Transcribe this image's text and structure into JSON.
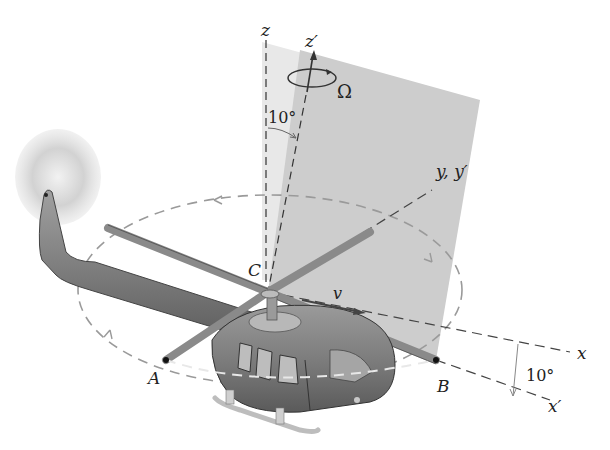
{
  "figure": {
    "colors": {
      "plane_light": "#e6e6e6",
      "plane_dark": "#c8c8c8",
      "body": "#7a7a7a",
      "body_dark": "#555555",
      "rotor": "#8c8c8c",
      "dash": "#9a9a9a",
      "axis": "#333333"
    },
    "labels": {
      "z": "z",
      "z_prime": "z′",
      "omega": "Ω",
      "angle_top": "10°",
      "y_axes": "y, y′",
      "C": "C",
      "v": "v",
      "A": "A",
      "B": "B",
      "x": "x",
      "x_prime": "x′",
      "angle_right": "10°"
    }
  }
}
